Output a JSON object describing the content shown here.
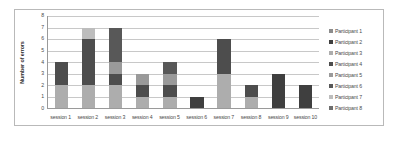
{
  "chart_data": {
    "type": "bar",
    "subtype": "stacked-column",
    "title": "",
    "xlabel": "",
    "ylabel": "Number of errors",
    "ylim": [
      0,
      8
    ],
    "yticks": [
      0,
      1,
      2,
      3,
      4,
      5,
      6,
      7,
      8
    ],
    "grid": true,
    "legend_position": "right",
    "categories": [
      "session 1",
      "session 2",
      "session 3",
      "session 4",
      "session 5",
      "session 6",
      "session 7",
      "session 8",
      "session 9",
      "session 10"
    ],
    "series": [
      {
        "name": "Participant 1",
        "color": "#8c8c8c",
        "values": [
          0,
          0,
          0,
          0,
          0,
          0,
          0,
          0,
          0,
          0
        ]
      },
      {
        "name": "Participant 2",
        "color": "#3f3f3f",
        "values": [
          0,
          0,
          0,
          0,
          0,
          1,
          0,
          0,
          3,
          2
        ]
      },
      {
        "name": "Participant 3",
        "color": "#adadad",
        "values": [
          2,
          2,
          2,
          1,
          1,
          0,
          3,
          1,
          0,
          0
        ]
      },
      {
        "name": "Participant 4",
        "color": "#4d4d4d",
        "values": [
          2,
          4,
          1,
          1,
          1,
          0,
          3,
          1,
          0,
          0
        ]
      },
      {
        "name": "Participant 5",
        "color": "#9a9a9a",
        "values": [
          0,
          0,
          1,
          1,
          1,
          0,
          0,
          0,
          0,
          0
        ]
      },
      {
        "name": "Participant 6",
        "color": "#585858",
        "values": [
          0,
          0,
          3,
          0,
          1,
          0,
          0,
          0,
          0,
          0
        ]
      },
      {
        "name": "Participant 7",
        "color": "#bdbdbd",
        "values": [
          0,
          1,
          0,
          0,
          0,
          0,
          0,
          0,
          0,
          0
        ]
      },
      {
        "name": "Participant 8",
        "color": "#6e6e6e",
        "values": [
          0,
          0,
          0,
          0,
          0,
          0,
          0,
          0,
          0,
          0
        ]
      }
    ],
    "totals": [
      4,
      7,
      7,
      3,
      4,
      1,
      6,
      2,
      3,
      2
    ]
  },
  "legend": {
    "items": [
      {
        "label": "Participant 1",
        "color": "#8c8c8c"
      },
      {
        "label": "Participant 2",
        "color": "#3f3f3f"
      },
      {
        "label": "Participant 3",
        "color": "#adadad"
      },
      {
        "label": "Participant 4",
        "color": "#4d4d4d"
      },
      {
        "label": "Participant 5",
        "color": "#9a9a9a"
      },
      {
        "label": "Participant 6",
        "color": "#585858"
      },
      {
        "label": "Participant 7",
        "color": "#bdbdbd"
      },
      {
        "label": "Participant 8",
        "color": "#6e6e6e"
      }
    ]
  }
}
